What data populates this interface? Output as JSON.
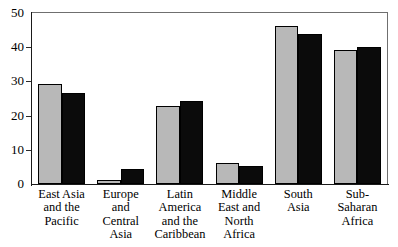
{
  "chart_data": {
    "type": "bar",
    "title": "",
    "xlabel": "",
    "ylabel": "",
    "ylim": [
      0,
      50
    ],
    "yticks": [
      0,
      10,
      20,
      30,
      40,
      50
    ],
    "grid": false,
    "legend": null,
    "categories": [
      "East Asia and the Pacific",
      "Europe and Central Asia",
      "Latin America and the Caribbean",
      "Middle East and North Africa",
      "South Asia",
      "Sub-Saharan Africa"
    ],
    "category_lines": [
      [
        "East Asia",
        "and the",
        "Pacific"
      ],
      [
        "Europe",
        "and",
        "Central",
        "Asia"
      ],
      [
        "Latin",
        "America",
        "and the",
        "Caribbean"
      ],
      [
        "Middle",
        "East and",
        "North",
        "Africa"
      ],
      [
        "South",
        "Asia"
      ],
      [
        "Sub-",
        "Saharan",
        "Africa"
      ]
    ],
    "series": [
      {
        "name": "series-1",
        "color": "#b8b8b8",
        "values": [
          29.2,
          1.2,
          22.8,
          6.0,
          46.3,
          39.3
        ]
      },
      {
        "name": "series-2",
        "color": "#0b0b0b",
        "values": [
          26.6,
          4.5,
          24.4,
          5.3,
          44.0,
          40.0
        ]
      }
    ]
  },
  "axis": {
    "y_tick_labels": [
      "50",
      "40",
      "30",
      "20",
      "10",
      "0"
    ]
  },
  "artifacts": {
    "top_clipped_text": ""
  }
}
